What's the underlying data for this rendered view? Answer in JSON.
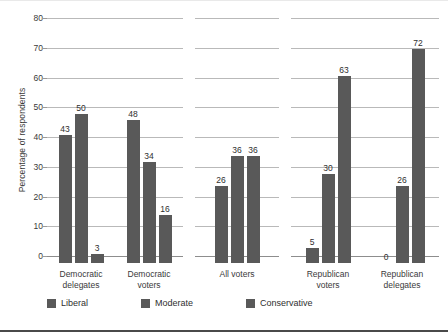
{
  "chart_data": {
    "type": "bar",
    "title": "",
    "subtitle": "",
    "xlabel": "",
    "ylabel": "Percentage of respondents",
    "ylim": [
      0,
      80
    ],
    "yticks": [
      0,
      10,
      20,
      30,
      40,
      50,
      60,
      70,
      80
    ],
    "grid": true,
    "legend_position": "bottom",
    "categories": [
      "Democratic delegates",
      "Democratic voters",
      "All voters",
      "Republican voters",
      "Republican delegates"
    ],
    "category_lines": [
      [
        "Democratic",
        "delegates"
      ],
      [
        "Democratic",
        "voters"
      ],
      [
        "All voters"
      ],
      [
        "Republican",
        "voters"
      ],
      [
        "Republican",
        "delegates"
      ]
    ],
    "series": [
      {
        "name": "Liberal",
        "color": "#595959",
        "values": [
          43,
          48,
          26,
          5,
          0
        ]
      },
      {
        "name": "Moderate",
        "color": "#595959",
        "values": [
          50,
          34,
          36,
          30,
          26
        ]
      },
      {
        "name": "Conservative",
        "color": "#595959",
        "values": [
          3,
          16,
          36,
          63,
          72
        ]
      }
    ],
    "panels": [
      {
        "name": "democratic",
        "categories": [
          "Democratic delegates",
          "Democratic voters"
        ]
      },
      {
        "name": "all-voters",
        "categories": [
          "All voters"
        ]
      },
      {
        "name": "republican",
        "categories": [
          "Republican voters",
          "Republican delegates"
        ]
      }
    ],
    "colors": {
      "bar": "#595959",
      "gridline": "#b9b9b9",
      "baseline": "#8d8d8d",
      "text": "#3a3a3a",
      "bottom_rule": "#4a4a4a",
      "top_rule": "#e9e9e9"
    }
  },
  "legend": {
    "items": [
      {
        "label": "Liberal"
      },
      {
        "label": "Moderate"
      },
      {
        "label": "Conservative"
      }
    ]
  }
}
